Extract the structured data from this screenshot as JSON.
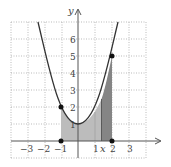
{
  "diagram": {
    "function": "y = x^2 + 1",
    "axes": {
      "x_label": "x",
      "y_label": "y",
      "x_ticks": [
        "−3",
        "−2",
        "−1",
        "1",
        "2",
        "3"
      ],
      "y_ticks": [
        "1",
        "2",
        "3",
        "4",
        "5",
        "6"
      ],
      "x_strip_label": "x"
    },
    "interval": {
      "a": -1,
      "b": 2
    },
    "points": [
      {
        "x": -1,
        "y": 2
      },
      {
        "x": 2,
        "y": 5
      },
      {
        "x": -1,
        "y": 0
      },
      {
        "x": 2,
        "y": 0
      }
    ],
    "strip": {
      "x_start": 1.35,
      "x_end": 2
    },
    "colors": {
      "curve": "#333333",
      "light_fill": "#b8b8b8",
      "dark_fill": "#808080",
      "grid": "#aaaaaa",
      "axis": "#555555"
    }
  }
}
